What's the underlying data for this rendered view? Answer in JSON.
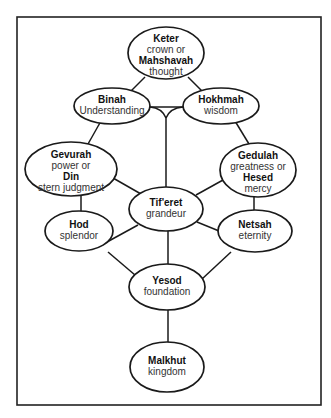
{
  "diagram": {
    "colors": {
      "line": "#1a1a1a",
      "node_fill": "#ffffff",
      "text_bold": "#111111",
      "text_regular": "#333333",
      "background": "#ffffff"
    },
    "nodes": {
      "keter": {
        "lines": [
          {
            "text": "Keter",
            "bold": true
          },
          {
            "text": "crown or",
            "bold": false
          },
          {
            "text": "Mahshavah",
            "bold": true
          },
          {
            "text": "thought",
            "bold": false
          }
        ]
      },
      "binah": {
        "lines": [
          {
            "text": "Binah",
            "bold": true
          },
          {
            "text": "Understanding",
            "bold": false
          }
        ]
      },
      "hokhmah": {
        "lines": [
          {
            "text": "Hokhmah",
            "bold": true
          },
          {
            "text": "wisdom",
            "bold": false
          }
        ]
      },
      "gevurah": {
        "lines": [
          {
            "text": "Gevurah",
            "bold": true
          },
          {
            "text": "power or",
            "bold": false
          },
          {
            "text": "Din",
            "bold": true
          },
          {
            "text": "stern judgment",
            "bold": false
          }
        ]
      },
      "gedulah": {
        "lines": [
          {
            "text": "Gedulah",
            "bold": true
          },
          {
            "text": "greatness or",
            "bold": false
          },
          {
            "text": "Hesed",
            "bold": true
          },
          {
            "text": "mercy",
            "bold": false
          }
        ]
      },
      "tiferet": {
        "lines": [
          {
            "text": "Tif'eret",
            "bold": true
          },
          {
            "text": "grandeur",
            "bold": false
          }
        ]
      },
      "hod": {
        "lines": [
          {
            "text": "Hod",
            "bold": true
          },
          {
            "text": "splendor",
            "bold": false
          }
        ]
      },
      "netsah": {
        "lines": [
          {
            "text": "Netsah",
            "bold": true
          },
          {
            "text": "eternity",
            "bold": false
          }
        ]
      },
      "yesod": {
        "lines": [
          {
            "text": "Yesod",
            "bold": true
          },
          {
            "text": "foundation",
            "bold": false
          }
        ]
      },
      "malkhut": {
        "lines": [
          {
            "text": "Malkhut",
            "bold": true
          },
          {
            "text": "kingdom",
            "bold": false
          }
        ]
      }
    },
    "edges": [
      [
        "keter",
        "binah"
      ],
      [
        "keter",
        "hokhmah"
      ],
      [
        "binah",
        "hokhmah"
      ],
      [
        "binah",
        "tiferet"
      ],
      [
        "hokhmah",
        "tiferet"
      ],
      [
        "binah",
        "gevurah"
      ],
      [
        "hokhmah",
        "gedulah"
      ],
      [
        "gevurah",
        "tiferet"
      ],
      [
        "gedulah",
        "tiferet"
      ],
      [
        "gevurah",
        "hod"
      ],
      [
        "gedulah",
        "netsah"
      ],
      [
        "hod",
        "tiferet"
      ],
      [
        "netsah",
        "tiferet"
      ],
      [
        "hod",
        "yesod"
      ],
      [
        "netsah",
        "yesod"
      ],
      [
        "tiferet",
        "yesod"
      ],
      [
        "yesod",
        "malkhut"
      ]
    ]
  }
}
